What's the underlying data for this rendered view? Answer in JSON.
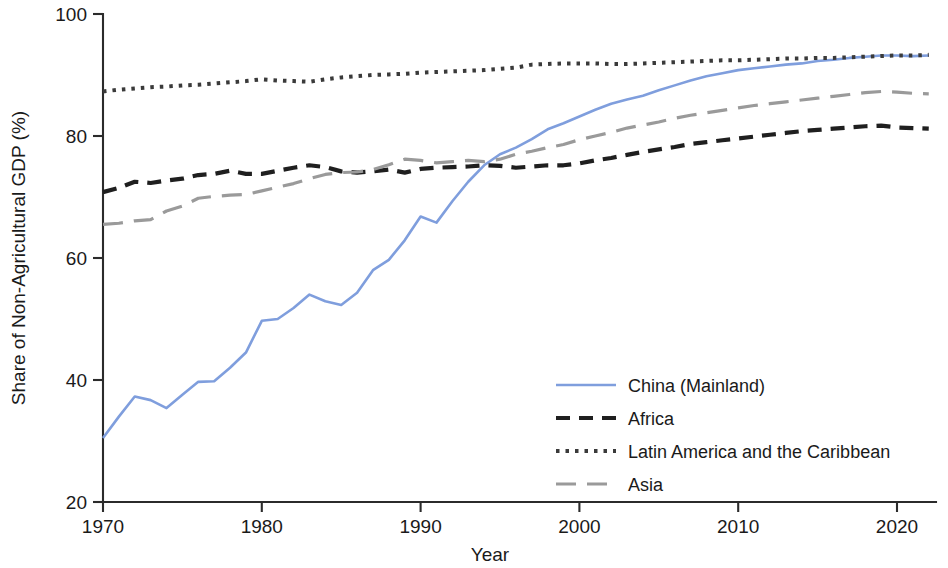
{
  "chart_data": {
    "type": "line",
    "title": "",
    "xlabel": "Year",
    "ylabel": "Share of Non-Agricultural GDP (%)",
    "xlim": [
      1969,
      2023
    ],
    "ylim": [
      18.5,
      101
    ],
    "grid": false,
    "legend_position": "center-right",
    "xticks": [
      1970,
      1980,
      1990,
      2000,
      2010,
      2020
    ],
    "xtick_labels": [
      "1970",
      "1980",
      "1990",
      "2000",
      "2010",
      "2020"
    ],
    "yticks": [
      20,
      40,
      60,
      80,
      100
    ],
    "ytick_labels": [
      "20",
      "40",
      "60",
      "80",
      "100"
    ],
    "x": [
      1970,
      1971,
      1972,
      1973,
      1974,
      1975,
      1976,
      1977,
      1978,
      1979,
      1980,
      1981,
      1982,
      1983,
      1984,
      1985,
      1986,
      1987,
      1988,
      1989,
      1990,
      1991,
      1992,
      1993,
      1994,
      1995,
      1996,
      1997,
      1998,
      1999,
      2000,
      2001,
      2002,
      2003,
      2004,
      2005,
      2006,
      2007,
      2008,
      2009,
      2010,
      2011,
      2012,
      2013,
      2014,
      2015,
      2016,
      2017,
      2018,
      2019,
      2020,
      2021,
      2022
    ],
    "series": [
      {
        "name": "China (Mainland)",
        "color": "#7f9edd",
        "style": "solid",
        "values": [
          30.5,
          34.0,
          37.3,
          36.7,
          35.4,
          37.6,
          39.7,
          39.8,
          42.0,
          44.5,
          49.7,
          50.0,
          51.8,
          54.0,
          52.9,
          52.3,
          54.3,
          58.0,
          59.7,
          62.9,
          66.8,
          65.8,
          69.3,
          72.5,
          75.2,
          77.0,
          78.1,
          79.5,
          81.1,
          82.1,
          83.2,
          84.3,
          85.3,
          86.0,
          86.6,
          87.5,
          88.3,
          89.1,
          89.8,
          90.3,
          90.8,
          91.1,
          91.4,
          91.7,
          91.9,
          92.3,
          92.5,
          92.8,
          93.0,
          93.2,
          93.2,
          93.1,
          93.2
        ]
      },
      {
        "name": "Africa",
        "color": "#1f1f1f",
        "style": "dashed",
        "values": [
          70.8,
          71.5,
          72.5,
          72.3,
          72.7,
          73.0,
          73.6,
          73.8,
          74.3,
          73.8,
          73.8,
          74.3,
          74.8,
          75.2,
          74.9,
          74.2,
          74.0,
          74.2,
          74.5,
          74.0,
          74.6,
          74.8,
          74.9,
          75.0,
          75.2,
          75.1,
          74.8,
          75.0,
          75.2,
          75.2,
          75.5,
          76.0,
          76.4,
          76.9,
          77.4,
          77.8,
          78.2,
          78.7,
          79.0,
          79.3,
          79.6,
          79.9,
          80.2,
          80.5,
          80.8,
          81.0,
          81.2,
          81.4,
          81.6,
          81.7,
          81.4,
          81.3,
          81.2
        ]
      },
      {
        "name": "Latin America and the Caribbean",
        "color": "#3a3a3a",
        "style": "dotted",
        "values": [
          87.3,
          87.6,
          87.8,
          88.0,
          88.1,
          88.3,
          88.4,
          88.6,
          88.8,
          89.0,
          89.3,
          89.1,
          89.0,
          88.9,
          89.3,
          89.6,
          89.8,
          90.0,
          90.1,
          90.2,
          90.4,
          90.5,
          90.6,
          90.7,
          90.8,
          91.0,
          91.2,
          91.7,
          91.8,
          91.9,
          91.9,
          91.9,
          91.8,
          91.8,
          91.9,
          92.0,
          92.1,
          92.2,
          92.3,
          92.4,
          92.4,
          92.5,
          92.6,
          92.7,
          92.7,
          92.8,
          92.8,
          92.9,
          93.0,
          93.1,
          93.2,
          93.2,
          93.3
        ]
      },
      {
        "name": "Asia",
        "color": "#9a9a9a",
        "style": "longdash",
        "values": [
          65.5,
          65.7,
          66.1,
          66.3,
          67.7,
          68.5,
          69.8,
          70.1,
          70.3,
          70.4,
          71.0,
          71.6,
          72.2,
          73.0,
          73.7,
          74.0,
          74.1,
          74.5,
          75.3,
          76.2,
          76.0,
          75.6,
          75.8,
          76.0,
          75.8,
          76.2,
          77.0,
          77.5,
          78.1,
          78.6,
          79.4,
          80.0,
          80.6,
          81.3,
          81.8,
          82.3,
          82.9,
          83.4,
          83.8,
          84.2,
          84.6,
          85.0,
          85.3,
          85.6,
          85.9,
          86.2,
          86.5,
          86.8,
          87.1,
          87.3,
          87.2,
          87.0,
          86.9
        ]
      }
    ]
  },
  "legend": {
    "items": [
      {
        "label": "China (Mainland)"
      },
      {
        "label": "Africa"
      },
      {
        "label": "Latin America and the Caribbean"
      },
      {
        "label": "Asia"
      }
    ]
  }
}
